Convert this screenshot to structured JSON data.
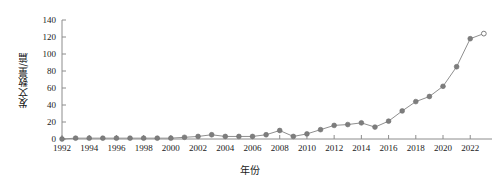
{
  "chart_data": {
    "type": "line",
    "title": "",
    "xlabel": "年份",
    "ylabel": "发文数量/篇",
    "xlim": [
      1992,
      2023.6
    ],
    "ylim": [
      0,
      140
    ],
    "grid": false,
    "legend": null,
    "ytick_labels": [
      "0",
      "20",
      "40",
      "60",
      "80",
      "100",
      "120",
      "140"
    ],
    "ytick_values": [
      0,
      20,
      40,
      60,
      80,
      100,
      120,
      140
    ],
    "xtick_labels": [
      "1992",
      "1994",
      "1996",
      "1998",
      "2000",
      "2002",
      "2004",
      "2006",
      "2008",
      "2010",
      "2012",
      "2014",
      "2016",
      "2018",
      "2020",
      "2022"
    ],
    "xtick_values": [
      1992,
      1994,
      1996,
      1998,
      2000,
      2002,
      2004,
      2006,
      2008,
      2010,
      2012,
      2014,
      2016,
      2018,
      2020,
      2022
    ],
    "x": [
      1992,
      1993,
      1994,
      1995,
      1996,
      1997,
      1998,
      1999,
      2000,
      2001,
      2002,
      2003,
      2004,
      2005,
      2006,
      2007,
      2008,
      2009,
      2010,
      2011,
      2012,
      2013,
      2014,
      2015,
      2016,
      2017,
      2018,
      2019,
      2020,
      2021,
      2022,
      2023
    ],
    "values": [
      0,
      1,
      1,
      1,
      1,
      1,
      1,
      1,
      1,
      2,
      3,
      5,
      3,
      3,
      3,
      5,
      10,
      3,
      6,
      11,
      16,
      17,
      19,
      14,
      21,
      33,
      44,
      50,
      62,
      85,
      118,
      124
    ],
    "open_marker_index": 31,
    "series_name": "发文数量",
    "line_color": "#8f8f8f",
    "marker_color": "#7d7d7d",
    "axis_color": "#8c8c8c"
  }
}
